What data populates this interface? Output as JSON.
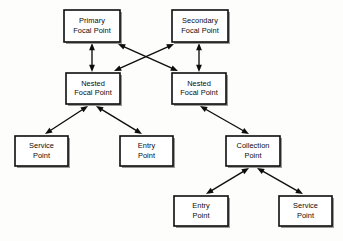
{
  "diagram": {
    "background_color": "#fdfdfc",
    "line_color": "#0d0d0d",
    "box_fill": "#ffffff",
    "text_color": "#0a0a0a",
    "nodes": [
      {
        "id": "primary-focal-point",
        "line1": "Primary",
        "line2": "Focal Point",
        "x": 64,
        "y": 10,
        "w": 56,
        "h": 32
      },
      {
        "id": "secondary-focal-point",
        "line1": "Secondary",
        "line2": "Focal Point",
        "x": 172,
        "y": 10,
        "w": 56,
        "h": 32
      },
      {
        "id": "nested-focal-point-left",
        "line1": "Nested",
        "line2": "Focal Point",
        "x": 66,
        "y": 73,
        "w": 54,
        "h": 31
      },
      {
        "id": "nested-focal-point-right",
        "line1": "Nested",
        "line2": "Focal Point",
        "x": 172,
        "y": 73,
        "w": 54,
        "h": 31
      },
      {
        "id": "service-point-left",
        "line1": "Service",
        "line2": "Point",
        "x": 15,
        "y": 136,
        "w": 53,
        "h": 30
      },
      {
        "id": "entry-point-middle",
        "line1": "Entry",
        "line2": "Point",
        "x": 120,
        "y": 136,
        "w": 53,
        "h": 30
      },
      {
        "id": "collection-point",
        "line1": "Collection",
        "line2": "Point",
        "x": 226,
        "y": 136,
        "w": 54,
        "h": 30
      },
      {
        "id": "entry-point-bottom",
        "line1": "Entry",
        "line2": "Point",
        "x": 174,
        "y": 196,
        "w": 54,
        "h": 30
      },
      {
        "id": "service-point-bottom",
        "line1": "Service",
        "line2": "Point",
        "x": 279,
        "y": 196,
        "w": 53,
        "h": 30
      }
    ],
    "edges": [
      {
        "id": "edge-primary-to-nested-left",
        "from": "primary-focal-point",
        "to": "nested-focal-point-left",
        "x1": 92,
        "y1": 43,
        "x2": 92,
        "y2": 72,
        "arrow_start": true,
        "arrow_end": true
      },
      {
        "id": "edge-secondary-to-nested-right",
        "from": "secondary-focal-point",
        "to": "nested-focal-point-right",
        "x1": 199,
        "y1": 43,
        "x2": 199,
        "y2": 72,
        "arrow_start": true,
        "arrow_end": true
      },
      {
        "id": "edge-primary-to-nested-right",
        "from": "primary-focal-point",
        "to": "nested-focal-point-right",
        "x1": 118,
        "y1": 44,
        "x2": 178,
        "y2": 71,
        "arrow_start": true,
        "arrow_end": true
      },
      {
        "id": "edge-secondary-to-nested-left",
        "from": "secondary-focal-point",
        "to": "nested-focal-point-left",
        "x1": 174,
        "y1": 44,
        "x2": 114,
        "y2": 71,
        "arrow_start": true,
        "arrow_end": true
      },
      {
        "id": "edge-nested-left-to-service-left",
        "from": "nested-focal-point-left",
        "to": "service-point-left",
        "x1": 88,
        "y1": 106,
        "x2": 45,
        "y2": 134,
        "arrow_start": true,
        "arrow_end": true
      },
      {
        "id": "edge-nested-left-to-entry-middle",
        "from": "nested-focal-point-left",
        "to": "entry-point-middle",
        "x1": 96,
        "y1": 106,
        "x2": 142,
        "y2": 134,
        "arrow_start": true,
        "arrow_end": true
      },
      {
        "id": "edge-nested-right-to-collection",
        "from": "nested-focal-point-right",
        "to": "collection-point",
        "x1": 200,
        "y1": 106,
        "x2": 249,
        "y2": 134,
        "arrow_start": true,
        "arrow_end": true
      },
      {
        "id": "edge-collection-to-entry-bottom",
        "from": "collection-point",
        "to": "entry-point-bottom",
        "x1": 249,
        "y1": 168,
        "x2": 206,
        "y2": 194,
        "arrow_start": true,
        "arrow_end": true
      },
      {
        "id": "edge-collection-to-service-bottom",
        "from": "collection-point",
        "to": "service-point-bottom",
        "x1": 257,
        "y1": 168,
        "x2": 303,
        "y2": 194,
        "arrow_start": true,
        "arrow_end": true
      }
    ]
  }
}
